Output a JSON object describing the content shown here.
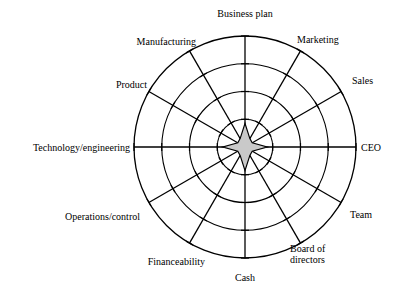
{
  "chart_data": {
    "type": "radar",
    "title": "",
    "subtitle": "",
    "xlabel": "",
    "ylabel": "",
    "grid": true,
    "legend": "none",
    "rings": 4,
    "ticks_per_axis": 4,
    "scale_min": 0,
    "scale_max": 4,
    "fill_color": "#c9c9c9",
    "line_color": "#000000",
    "categories": [
      "Business plan",
      "Marketing",
      "Sales",
      "CEO",
      "Team",
      "Board of\ndirectors",
      "Cash",
      "Financeability",
      "Operations/control",
      "Technology/engineering",
      "Product",
      "Manufacturing"
    ],
    "series": [
      {
        "name": "Assessment",
        "values": [
          0.85,
          0.35,
          0.3,
          0.8,
          0.3,
          0.35,
          0.85,
          0.35,
          0.3,
          0.8,
          0.3,
          0.35
        ]
      }
    ]
  },
  "labels": {
    "business_plan": "Business plan",
    "marketing": "Marketing",
    "sales": "Sales",
    "ceo": "CEO",
    "team": "Team",
    "board_of_directors": "Board of\ndirectors",
    "cash": "Cash",
    "financeability": "Financeability",
    "operations_control": "Operations/control",
    "technology_engineering": "Technology/engineering",
    "product": "Product",
    "manufacturing": "Manufacturing"
  }
}
